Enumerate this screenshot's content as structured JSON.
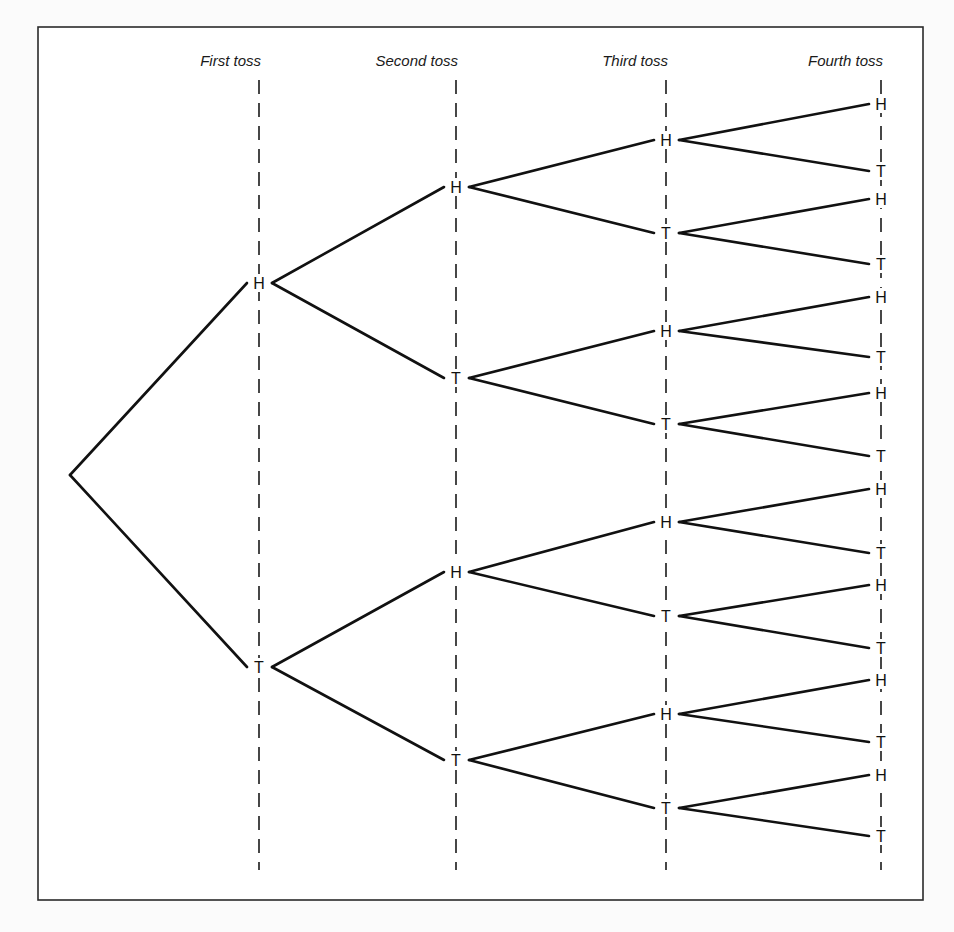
{
  "diagram": {
    "type": "probability-tree",
    "frame": {
      "x": 38,
      "y": 27,
      "width": 885,
      "height": 873
    },
    "colors": {
      "line": "#111111",
      "text": "#111111",
      "background": "#ffffff"
    },
    "columns": [
      {
        "id": "first",
        "label": "First toss",
        "x": 259
      },
      {
        "id": "second",
        "label": "Second toss",
        "x": 456
      },
      {
        "id": "third",
        "label": "Third toss",
        "x": 666
      },
      {
        "id": "fourth",
        "label": "Fourth toss",
        "x": 881
      }
    ],
    "root": {
      "x": 70,
      "y": 475
    },
    "levels": [
      {
        "column": "first",
        "nodes": [
          {
            "label": "H",
            "y": 283,
            "parent": "root"
          },
          {
            "label": "T",
            "y": 667,
            "parent": "root"
          }
        ]
      },
      {
        "column": "second",
        "nodes": [
          {
            "label": "H",
            "y": 187,
            "parent": 0
          },
          {
            "label": "T",
            "y": 378,
            "parent": 0
          },
          {
            "label": "H",
            "y": 572,
            "parent": 1
          },
          {
            "label": "T",
            "y": 760,
            "parent": 1
          }
        ]
      },
      {
        "column": "third",
        "nodes": [
          {
            "label": "H",
            "y": 140,
            "parent": 0
          },
          {
            "label": "T",
            "y": 233,
            "parent": 0
          },
          {
            "label": "H",
            "y": 331,
            "parent": 1
          },
          {
            "label": "T",
            "y": 424,
            "parent": 1
          },
          {
            "label": "H",
            "y": 522,
            "parent": 2
          },
          {
            "label": "T",
            "y": 616,
            "parent": 2
          },
          {
            "label": "H",
            "y": 714,
            "parent": 3
          },
          {
            "label": "T",
            "y": 808,
            "parent": 3
          }
        ]
      },
      {
        "column": "fourth",
        "nodes": [
          {
            "label": "H",
            "y": 104,
            "parent": 0
          },
          {
            "label": "T",
            "y": 171,
            "parent": 0
          },
          {
            "label": "H",
            "y": 199,
            "parent": 1
          },
          {
            "label": "T",
            "y": 264,
            "parent": 1
          },
          {
            "label": "H",
            "y": 297,
            "parent": 2
          },
          {
            "label": "T",
            "y": 357,
            "parent": 2
          },
          {
            "label": "H",
            "y": 393,
            "parent": 3
          },
          {
            "label": "T",
            "y": 456,
            "parent": 3
          },
          {
            "label": "H",
            "y": 489,
            "parent": 4
          },
          {
            "label": "T",
            "y": 553,
            "parent": 4
          },
          {
            "label": "H",
            "y": 585,
            "parent": 5
          },
          {
            "label": "T",
            "y": 648,
            "parent": 5
          },
          {
            "label": "H",
            "y": 680,
            "parent": 6
          },
          {
            "label": "T",
            "y": 742,
            "parent": 6
          },
          {
            "label": "H",
            "y": 775,
            "parent": 7
          },
          {
            "label": "T",
            "y": 836,
            "parent": 7
          }
        ]
      }
    ],
    "guides": {
      "y_start": 80,
      "y_end": 870
    }
  }
}
